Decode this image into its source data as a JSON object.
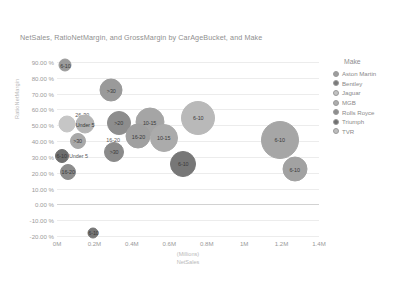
{
  "chart_data": {
    "type": "scatter",
    "title": "NetSales, RatioNetMargin, and GrossMargin by CarAgeBucket, and Make",
    "xlabel_line1": "(Millions)",
    "xlabel_line2": "NetSales",
    "ylabel": "RatioNetMargin",
    "grid": true,
    "legend_position": "right",
    "xlim": [
      0,
      1.4
    ],
    "ylim": [
      -0.2,
      0.9
    ],
    "xticks": [
      "0M",
      "0.2M",
      "0.4M",
      "0.6M",
      "0.8M",
      "1M",
      "1.2M",
      "1.4M"
    ],
    "xtick_values": [
      0,
      0.2,
      0.4,
      0.6,
      0.8,
      1.0,
      1.2,
      1.4
    ],
    "yticks": [
      "90.00 %",
      "80.00 %",
      "70.00 %",
      "60.00 %",
      "50.00 %",
      "40.00 %",
      "30.00 %",
      "20.00 %",
      "10.00 %",
      "0.00 %",
      "-10.00 %",
      "-20.00 %"
    ],
    "ytick_values": [
      0.9,
      0.8,
      0.7,
      0.6,
      0.5,
      0.4,
      0.3,
      0.2,
      0.1,
      0.0,
      -0.1,
      -0.2
    ],
    "legend": {
      "title": "Make",
      "entries": [
        {
          "label": "Aston Martin",
          "color": "#9d9d9d"
        },
        {
          "label": "Bentley",
          "color": "#7a7a7a"
        },
        {
          "label": "Jaguar",
          "color": "#c2c2c2"
        },
        {
          "label": "MGB",
          "color": "#adadad"
        },
        {
          "label": "Rolls Royce",
          "color": "#8d8d8d"
        },
        {
          "label": "Triumph",
          "color": "#6f6f6f"
        },
        {
          "label": "TVR",
          "color": "#bdbdbd"
        }
      ]
    },
    "bubbles": [
      {
        "label": "6-10",
        "x": 0.045,
        "y": 0.88,
        "size": 13,
        "color": "#9b9b9b",
        "inside": true
      },
      {
        "label": ">30",
        "x": 0.29,
        "y": 0.72,
        "size": 23,
        "color": "#9a9a9a",
        "inside": true
      },
      {
        "label": "26-30",
        "x": 0.135,
        "y": 0.562,
        "size": 0,
        "color": "#8f8f8f",
        "inside": false
      },
      {
        "label": "",
        "x": 0.055,
        "y": 0.508,
        "size": 17,
        "color": "#c6c6c6",
        "inside": true
      },
      {
        "label": "Under 5",
        "x": 0.15,
        "y": 0.508,
        "size": 19,
        "color": "#b4b4b4",
        "inside": true
      },
      {
        "label": ">20",
        "x": 0.33,
        "y": 0.512,
        "size": 24,
        "color": "#8d8d8d",
        "inside": true
      },
      {
        "label": "10-15",
        "x": 0.495,
        "y": 0.52,
        "size": 29,
        "color": "#a5a5a5",
        "inside": true
      },
      {
        "label": "6-10",
        "x": 0.755,
        "y": 0.545,
        "size": 34,
        "color": "#b9b9b9",
        "inside": true
      },
      {
        "label": ">30",
        "x": 0.11,
        "y": 0.4,
        "size": 16,
        "color": "#a8a8a8",
        "inside": true
      },
      {
        "label": "16-20",
        "x": 0.3,
        "y": 0.41,
        "size": 0,
        "color": "#5a5a5a",
        "inside": false
      },
      {
        "label": "16-20",
        "x": 0.435,
        "y": 0.43,
        "size": 25,
        "color": "#a0a0a0",
        "inside": true
      },
      {
        "label": "10-15",
        "x": 0.57,
        "y": 0.42,
        "size": 28,
        "color": "#ababab",
        "inside": true
      },
      {
        "label": "6-10",
        "x": 1.19,
        "y": 0.408,
        "size": 38,
        "color": "#a6a6a6",
        "inside": true
      },
      {
        "label": "6-10",
        "x": 0.025,
        "y": 0.308,
        "size": 14,
        "color": "#6e6e6e",
        "inside": true
      },
      {
        "label": "Under 5",
        "x": 0.115,
        "y": 0.305,
        "size": 0,
        "color": "#5a5a5a",
        "inside": false
      },
      {
        "label": ">30",
        "x": 0.305,
        "y": 0.33,
        "size": 20,
        "color": "#8a8a8a",
        "inside": true
      },
      {
        "label": "6-10",
        "x": 0.675,
        "y": 0.255,
        "size": 26,
        "color": "#777777",
        "inside": true
      },
      {
        "label": "16-20",
        "x": 0.06,
        "y": 0.205,
        "size": 16,
        "color": "#8c8c8c",
        "inside": true
      },
      {
        "label": "6-10",
        "x": 1.27,
        "y": 0.222,
        "size": 25,
        "color": "#a2a2a2",
        "inside": true
      },
      {
        "label": "6-10",
        "x": 0.195,
        "y": -0.178,
        "size": 11,
        "color": "#777777",
        "inside": true
      }
    ]
  }
}
